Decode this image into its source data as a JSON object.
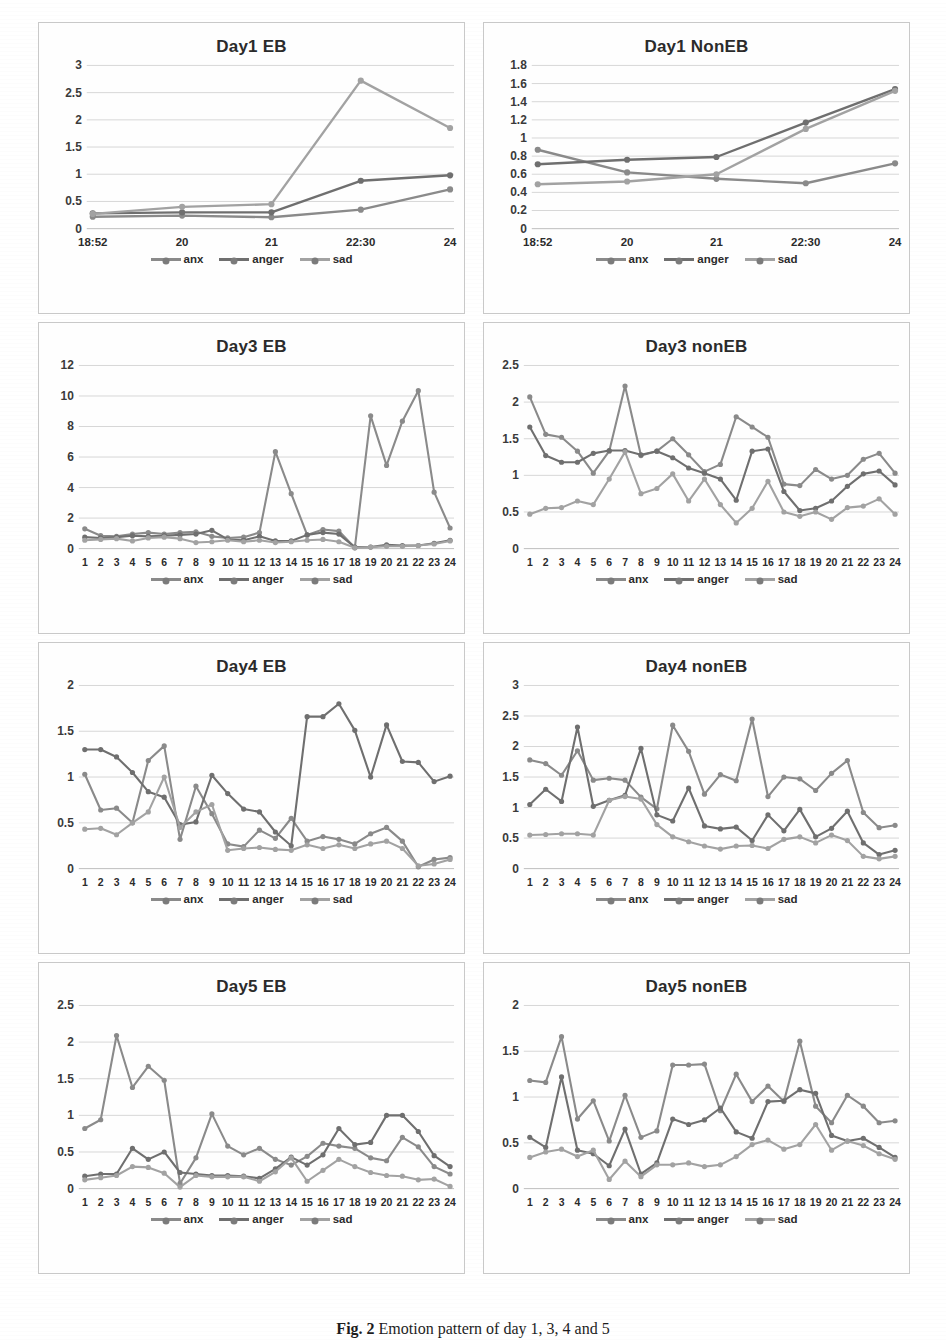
{
  "caption": {
    "label": "Fig. 2",
    "text": "Emotion pattern of  day 1, 3, 4 and 5"
  },
  "legend": {
    "items": [
      {
        "label": "anx",
        "color": "#8a8a8a"
      },
      {
        "label": "anger",
        "color": "#7c7c7c"
      },
      {
        "label": "sad",
        "color": "#9a9a9a"
      }
    ]
  },
  "series_colors": {
    "anx": "#8a8a8a",
    "anger": "#6f6f6f",
    "sad": "#a2a2a2"
  },
  "chart_data": [
    {
      "id": "day1-eb",
      "type": "line",
      "title": "Day1 EB",
      "xlabel": "",
      "ylabel": "",
      "categories": [
        "18:52",
        "20",
        "21",
        "22:30",
        "24"
      ],
      "yticks": [
        0,
        0.5,
        1,
        1.5,
        2,
        2.5,
        3
      ],
      "ylim": [
        0,
        3
      ],
      "grid": true,
      "legend_position": "bottom",
      "series": [
        {
          "name": "anx",
          "values": [
            0.22,
            0.24,
            0.21,
            0.35,
            0.72
          ]
        },
        {
          "name": "anger",
          "values": [
            0.28,
            0.3,
            0.3,
            0.88,
            0.98
          ]
        },
        {
          "name": "sad",
          "values": [
            0.27,
            0.4,
            0.45,
            2.72,
            1.85
          ]
        }
      ]
    },
    {
      "id": "day1-noneb",
      "type": "line",
      "title": "Day1 NonEB",
      "xlabel": "",
      "ylabel": "",
      "categories": [
        "18:52",
        "20",
        "21",
        "22:30",
        "24"
      ],
      "yticks": [
        0,
        0.2,
        0.4,
        0.6,
        0.8,
        1,
        1.2,
        1.4,
        1.6,
        1.8
      ],
      "ylim": [
        0,
        1.8
      ],
      "grid": true,
      "legend_position": "bottom",
      "series": [
        {
          "name": "anx",
          "values": [
            0.87,
            0.62,
            0.55,
            0.5,
            0.72
          ]
        },
        {
          "name": "anger",
          "values": [
            0.71,
            0.76,
            0.79,
            1.17,
            1.54
          ]
        },
        {
          "name": "sad",
          "values": [
            0.49,
            0.52,
            0.6,
            1.1,
            1.52
          ]
        }
      ]
    },
    {
      "id": "day3-eb",
      "type": "line",
      "title": "Day3 EB",
      "xlabel": "",
      "ylabel": "",
      "categories": [
        "1",
        "2",
        "3",
        "4",
        "5",
        "6",
        "7",
        "8",
        "9",
        "10",
        "11",
        "12",
        "13",
        "14",
        "15",
        "16",
        "17",
        "18",
        "19",
        "20",
        "21",
        "22",
        "23",
        "24"
      ],
      "yticks": [
        0,
        2,
        4,
        6,
        8,
        10,
        12
      ],
      "ylim": [
        0,
        12
      ],
      "grid": true,
      "legend_position": "bottom",
      "series": [
        {
          "name": "anx",
          "values": [
            1.3,
            0.85,
            0.8,
            0.95,
            1.05,
            0.95,
            1.05,
            1.1,
            0.8,
            0.7,
            0.75,
            1.05,
            6.35,
            3.6,
            0.9,
            1.25,
            1.15,
            0.05,
            8.7,
            5.45,
            8.35,
            10.35,
            3.7,
            1.35
          ]
        },
        {
          "name": "anger",
          "values": [
            0.75,
            0.7,
            0.75,
            0.85,
            0.8,
            0.85,
            0.9,
            0.95,
            1.2,
            0.6,
            0.55,
            0.8,
            0.5,
            0.5,
            0.9,
            1.05,
            0.95,
            0.1,
            0.1,
            0.25,
            0.2,
            0.2,
            0.35,
            0.55
          ]
        },
        {
          "name": "sad",
          "values": [
            0.55,
            0.6,
            0.65,
            0.5,
            0.7,
            0.75,
            0.65,
            0.4,
            0.45,
            0.55,
            0.45,
            0.55,
            0.4,
            0.45,
            0.55,
            0.6,
            0.45,
            0.05,
            0.1,
            0.15,
            0.15,
            0.2,
            0.3,
            0.5
          ]
        }
      ]
    },
    {
      "id": "day3-noneb",
      "type": "line",
      "title": "Day3 nonEB",
      "xlabel": "",
      "ylabel": "",
      "categories": [
        "1",
        "2",
        "3",
        "4",
        "5",
        "6",
        "7",
        "8",
        "9",
        "10",
        "11",
        "12",
        "13",
        "14",
        "15",
        "16",
        "17",
        "18",
        "19",
        "20",
        "21",
        "22",
        "23",
        "24"
      ],
      "yticks": [
        0,
        0.5,
        1,
        1.5,
        2,
        2.5
      ],
      "ylim": [
        0,
        2.5
      ],
      "grid": true,
      "legend_position": "bottom",
      "series": [
        {
          "name": "anx",
          "values": [
            2.07,
            1.56,
            1.52,
            1.33,
            1.03,
            1.33,
            2.22,
            1.27,
            1.33,
            1.5,
            1.28,
            1.05,
            1.15,
            1.8,
            1.66,
            1.52,
            0.88,
            0.86,
            1.08,
            0.95,
            1.0,
            1.22,
            1.3,
            1.03
          ]
        },
        {
          "name": "anger",
          "values": [
            1.66,
            1.27,
            1.18,
            1.18,
            1.3,
            1.34,
            1.34,
            1.28,
            1.33,
            1.24,
            1.1,
            1.03,
            0.95,
            0.66,
            1.33,
            1.36,
            0.78,
            0.52,
            0.55,
            0.65,
            0.85,
            1.02,
            1.06,
            0.87
          ]
        },
        {
          "name": "sad",
          "values": [
            0.47,
            0.55,
            0.56,
            0.65,
            0.6,
            0.95,
            1.32,
            0.75,
            0.82,
            1.02,
            0.65,
            0.95,
            0.6,
            0.35,
            0.55,
            0.92,
            0.5,
            0.44,
            0.5,
            0.4,
            0.56,
            0.58,
            0.68,
            0.47
          ]
        }
      ]
    },
    {
      "id": "day4-eb",
      "type": "line",
      "title": "Day4 EB",
      "xlabel": "",
      "ylabel": "",
      "categories": [
        "1",
        "2",
        "3",
        "4",
        "5",
        "6",
        "7",
        "8",
        "9",
        "10",
        "11",
        "12",
        "13",
        "14",
        "15",
        "16",
        "17",
        "18",
        "19",
        "20",
        "21",
        "22",
        "23",
        "24"
      ],
      "yticks": [
        0,
        0.5,
        1,
        1.5,
        2
      ],
      "ylim": [
        0,
        2
      ],
      "grid": true,
      "legend_position": "bottom",
      "series": [
        {
          "name": "anx",
          "values": [
            1.03,
            0.64,
            0.66,
            0.5,
            1.18,
            1.34,
            0.32,
            0.9,
            0.6,
            0.27,
            0.24,
            0.42,
            0.33,
            0.55,
            0.3,
            0.35,
            0.32,
            0.27,
            0.38,
            0.45,
            0.3,
            0.02,
            0.1,
            0.12
          ]
        },
        {
          "name": "anger",
          "values": [
            1.3,
            1.3,
            1.22,
            1.05,
            0.84,
            0.78,
            0.48,
            0.51,
            1.02,
            0.82,
            0.65,
            0.62,
            0.4,
            0.25,
            1.66,
            1.66,
            1.8,
            1.51,
            1.0,
            1.57,
            1.17,
            1.16,
            0.95,
            1.01
          ]
        },
        {
          "name": "sad",
          "values": [
            0.43,
            0.44,
            0.37,
            0.5,
            0.62,
            1.0,
            0.45,
            0.62,
            0.7,
            0.2,
            0.22,
            0.23,
            0.21,
            0.2,
            0.26,
            0.22,
            0.26,
            0.22,
            0.27,
            0.3,
            0.22,
            0.03,
            0.05,
            0.1
          ]
        }
      ]
    },
    {
      "id": "day4-noneb",
      "type": "line",
      "title": "Day4 nonEB",
      "xlabel": "",
      "ylabel": "",
      "categories": [
        "1",
        "2",
        "3",
        "4",
        "5",
        "6",
        "7",
        "8",
        "9",
        "10",
        "11",
        "12",
        "13",
        "14",
        "15",
        "16",
        "17",
        "18",
        "19",
        "20",
        "21",
        "22",
        "23",
        "24"
      ],
      "yticks": [
        0,
        0.5,
        1,
        1.5,
        2,
        2.5,
        3
      ],
      "ylim": [
        0,
        3
      ],
      "grid": true,
      "legend_position": "bottom",
      "series": [
        {
          "name": "anx",
          "values": [
            1.78,
            1.72,
            1.53,
            1.93,
            1.45,
            1.48,
            1.45,
            1.17,
            0.98,
            2.35,
            1.92,
            1.22,
            1.54,
            1.44,
            2.45,
            1.18,
            1.5,
            1.47,
            1.28,
            1.56,
            1.77,
            0.92,
            0.67,
            0.71
          ]
        },
        {
          "name": "anger",
          "values": [
            1.05,
            1.3,
            1.1,
            2.32,
            1.02,
            1.12,
            1.2,
            1.97,
            0.88,
            0.78,
            1.32,
            0.7,
            0.65,
            0.68,
            0.46,
            0.88,
            0.62,
            0.97,
            0.52,
            0.66,
            0.94,
            0.42,
            0.23,
            0.3
          ]
        },
        {
          "name": "sad",
          "values": [
            0.55,
            0.56,
            0.57,
            0.57,
            0.55,
            1.12,
            1.18,
            1.14,
            0.72,
            0.52,
            0.44,
            0.37,
            0.32,
            0.37,
            0.38,
            0.33,
            0.48,
            0.52,
            0.42,
            0.55,
            0.46,
            0.2,
            0.16,
            0.2
          ]
        }
      ]
    },
    {
      "id": "day5-eb",
      "type": "line",
      "title": "Day5 EB",
      "xlabel": "",
      "ylabel": "",
      "categories": [
        "1",
        "2",
        "3",
        "4",
        "5",
        "6",
        "7",
        "8",
        "9",
        "10",
        "11",
        "12",
        "13",
        "14",
        "15",
        "16",
        "17",
        "18",
        "19",
        "20",
        "21",
        "22",
        "23",
        "24"
      ],
      "yticks": [
        0,
        0.5,
        1,
        1.5,
        2,
        2.5
      ],
      "ylim": [
        0,
        2.5
      ],
      "grid": true,
      "legend_position": "bottom",
      "series": [
        {
          "name": "anx",
          "values": [
            0.82,
            0.94,
            2.09,
            1.38,
            1.67,
            1.48,
            0.07,
            0.42,
            1.02,
            0.58,
            0.46,
            0.55,
            0.4,
            0.32,
            0.44,
            0.62,
            0.58,
            0.55,
            0.42,
            0.38,
            0.7,
            0.57,
            0.3,
            0.2
          ]
        },
        {
          "name": "anger",
          "values": [
            0.17,
            0.2,
            0.2,
            0.55,
            0.4,
            0.5,
            0.22,
            0.2,
            0.18,
            0.18,
            0.17,
            0.14,
            0.27,
            0.43,
            0.32,
            0.46,
            0.82,
            0.6,
            0.63,
            1.0,
            1.0,
            0.78,
            0.45,
            0.3
          ]
        },
        {
          "name": "sad",
          "values": [
            0.12,
            0.15,
            0.18,
            0.3,
            0.29,
            0.21,
            0.02,
            0.18,
            0.16,
            0.16,
            0.16,
            0.1,
            0.23,
            0.42,
            0.1,
            0.25,
            0.4,
            0.3,
            0.22,
            0.18,
            0.17,
            0.12,
            0.13,
            0.03
          ]
        }
      ]
    },
    {
      "id": "day5-noneb",
      "type": "line",
      "title": "Day5 nonEB",
      "xlabel": "",
      "ylabel": "",
      "categories": [
        "1",
        "2",
        "3",
        "4",
        "5",
        "6",
        "7",
        "8",
        "9",
        "10",
        "11",
        "12",
        "13",
        "14",
        "15",
        "16",
        "17",
        "18",
        "19",
        "20",
        "21",
        "22",
        "23",
        "24"
      ],
      "yticks": [
        0,
        0.5,
        1,
        1.5,
        2
      ],
      "ylim": [
        0,
        2
      ],
      "grid": true,
      "legend_position": "bottom",
      "series": [
        {
          "name": "anx",
          "values": [
            1.18,
            1.16,
            1.66,
            0.76,
            0.96,
            0.52,
            1.02,
            0.56,
            0.63,
            1.35,
            1.35,
            1.36,
            0.85,
            1.25,
            0.95,
            1.12,
            0.95,
            1.61,
            0.9,
            0.72,
            1.02,
            0.9,
            0.72,
            0.74
          ]
        },
        {
          "name": "anger",
          "values": [
            0.56,
            0.45,
            1.22,
            0.42,
            0.38,
            0.25,
            0.65,
            0.16,
            0.28,
            0.76,
            0.7,
            0.75,
            0.88,
            0.62,
            0.55,
            0.95,
            0.96,
            1.08,
            1.04,
            0.58,
            0.52,
            0.55,
            0.45,
            0.34
          ]
        },
        {
          "name": "sad",
          "values": [
            0.34,
            0.4,
            0.43,
            0.35,
            0.42,
            0.1,
            0.3,
            0.13,
            0.26,
            0.26,
            0.28,
            0.24,
            0.26,
            0.35,
            0.48,
            0.53,
            0.43,
            0.48,
            0.7,
            0.42,
            0.52,
            0.47,
            0.38,
            0.32
          ]
        }
      ]
    }
  ]
}
